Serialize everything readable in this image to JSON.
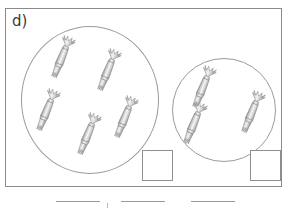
{
  "item": {
    "label": "d)",
    "type": "grouping-multiplication-worksheet"
  },
  "frame": {
    "name": "outer-frame",
    "border_color": "#8a8a8a"
  },
  "groups": [
    {
      "name": "left-group",
      "shape": "circle",
      "object": "wrapped-candy",
      "count": 5,
      "center": {
        "x": 90,
        "y": 100
      },
      "radius": 69,
      "candies": [
        {
          "x": 53,
          "y": 35,
          "rotate": 22
        },
        {
          "x": 99,
          "y": 48,
          "rotate": 22
        },
        {
          "x": 38,
          "y": 88,
          "rotate": 22
        },
        {
          "x": 79,
          "y": 112,
          "rotate": 22
        },
        {
          "x": 116,
          "y": 95,
          "rotate": 22
        }
      ]
    },
    {
      "name": "right-group",
      "shape": "circle",
      "object": "wrapped-candy",
      "count": 3,
      "center": {
        "x": 224,
        "y": 110
      },
      "radius": 52,
      "candies": [
        {
          "x": 194,
          "y": 65,
          "rotate": 22
        },
        {
          "x": 185,
          "y": 101,
          "rotate": 22
        },
        {
          "x": 243,
          "y": 90,
          "rotate": 22
        }
      ]
    }
  ],
  "answer_boxes": [
    {
      "name": "left-answer-box",
      "value": "",
      "placeholder": ""
    },
    {
      "name": "right-answer-box",
      "value": "",
      "placeholder": ""
    }
  ],
  "answer_lines": [
    {
      "name": "answer-line-1",
      "value": "",
      "placeholder": ""
    },
    {
      "name": "answer-line-2",
      "value": "",
      "placeholder": ""
    },
    {
      "name": "answer-line-3",
      "value": "",
      "placeholder": ""
    }
  ],
  "colors": {
    "frame_border": "#8a8a8a",
    "circle_border": "#9b9b9b",
    "box_border": "#8f8f8f",
    "line": "#9a9a9a",
    "candy_light": "#f2f2f2",
    "candy_mid": "#c9c9c9",
    "candy_dark": "#8e8e8e",
    "ink": "#3c3c3c",
    "page_background": "#ffffff"
  }
}
